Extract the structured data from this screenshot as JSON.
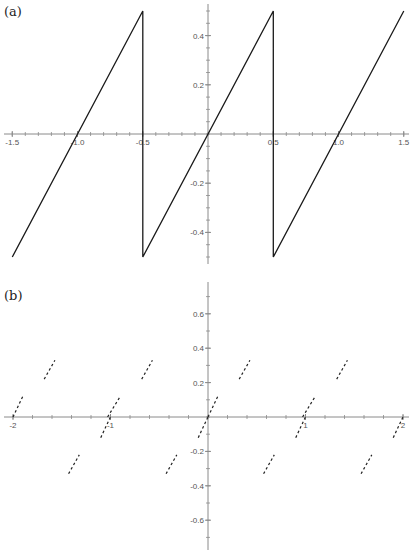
{
  "chart_data": [
    {
      "panel_label": "(a)",
      "type": "line",
      "title": "",
      "xlabel": "",
      "ylabel": "",
      "description": "Sawtooth wave with period 1, rising linearly with slope 1, jumps from 0.5 to -0.5 at x = -0.5 and x = 0.5",
      "xlim": [
        -1.55,
        1.55
      ],
      "ylim": [
        -0.5,
        0.5
      ],
      "x_ticks": [
        "-1.5",
        "-1.0",
        "-0.5",
        "0.5",
        "1.0",
        "1.5"
      ],
      "x_tick_values": [
        -1.5,
        -1.0,
        -0.5,
        0.5,
        1.0,
        1.5
      ],
      "y_ticks": [
        "0.4",
        "0.2",
        "-0.2",
        "-0.4"
      ],
      "y_tick_values": [
        0.4,
        0.2,
        -0.2,
        -0.4
      ],
      "grid": false,
      "series": [
        {
          "name": "sawtooth",
          "points": [
            [
              -1.5,
              -0.5
            ],
            [
              -0.5,
              0.5
            ],
            [
              -0.5,
              -0.5
            ],
            [
              0.5,
              0.5
            ],
            [
              0.5,
              -0.5
            ],
            [
              1.5,
              0.5
            ]
          ]
        }
      ]
    },
    {
      "panel_label": "(b)",
      "type": "scatter",
      "title": "",
      "xlabel": "",
      "ylabel": "",
      "description": "Sparse short dashed segments of slope ~1 arranged periodically (period 1), forming broken sawtooth-like pieces above and below the x-axis",
      "xlim": [
        -2.05,
        2.05
      ],
      "ylim": [
        -0.75,
        0.75
      ],
      "x_ticks": [
        "-2",
        "-1",
        "1",
        "2"
      ],
      "x_tick_values": [
        -2,
        -1,
        1,
        2
      ],
      "y_ticks": [
        "0.6",
        "0.4",
        "0.2",
        "-0.2",
        "-0.4",
        "-0.6"
      ],
      "y_tick_values": [
        0.6,
        0.4,
        0.2,
        -0.2,
        -0.4,
        -0.6
      ],
      "grid": false,
      "series": [
        {
          "name": "dashed-segments",
          "segments": [
            [
              [
                -2.0,
                0.0
              ],
              [
                -1.9,
                0.12
              ]
            ],
            [
              [
                -1.68,
                0.22
              ],
              [
                -1.57,
                0.33
              ]
            ],
            [
              [
                -1.03,
                -0.0
              ],
              [
                -0.9,
                0.12
              ]
            ],
            [
              [
                -0.68,
                0.22
              ],
              [
                -0.57,
                0.33
              ]
            ],
            [
              [
                -0.1,
                -0.12
              ],
              [
                0.0,
                0.0
              ]
            ],
            [
              [
                0.0,
                0.0
              ],
              [
                0.1,
                0.12
              ]
            ],
            [
              [
                0.32,
                0.22
              ],
              [
                0.43,
                0.33
              ]
            ],
            [
              [
                0.97,
                0.0
              ],
              [
                1.1,
                0.12
              ]
            ],
            [
              [
                1.32,
                0.22
              ],
              [
                1.43,
                0.33
              ]
            ],
            [
              [
                -1.1,
                -0.12
              ],
              [
                -1.0,
                0.0
              ]
            ],
            [
              [
                -1.43,
                -0.33
              ],
              [
                -1.32,
                -0.22
              ]
            ],
            [
              [
                -0.43,
                -0.33
              ],
              [
                -0.32,
                -0.22
              ]
            ],
            [
              [
                0.57,
                -0.33
              ],
              [
                0.68,
                -0.22
              ]
            ],
            [
              [
                0.9,
                -0.12
              ],
              [
                1.0,
                0.0
              ]
            ],
            [
              [
                1.57,
                -0.33
              ],
              [
                1.68,
                -0.22
              ]
            ],
            [
              [
                1.9,
                -0.12
              ],
              [
                2.0,
                0.0
              ]
            ]
          ]
        }
      ]
    }
  ],
  "panels": {
    "a": {
      "label": "(a)"
    },
    "b": {
      "label": "(b)"
    }
  }
}
